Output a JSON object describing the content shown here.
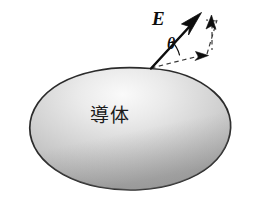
{
  "figure": {
    "background_color": "#ffffff",
    "width": 253,
    "height": 204
  },
  "labels": {
    "field_vector": "E",
    "angle": "θ",
    "conductor": "導体"
  },
  "colors": {
    "ink": "#0d0d0d",
    "outline": "#2b2b2b",
    "body_light": "#f2f2f2",
    "body_mid": "#c9c9c9",
    "body_dark": "#8f8f8f",
    "dashed": "#3a3a3a"
  },
  "geometry": {
    "origin": {
      "x": 151,
      "y": 68
    },
    "field_tip": {
      "x": 201,
      "y": 13
    },
    "normal_tip": {
      "x": 212,
      "y": 17
    },
    "tangent_tip": {
      "x": 206,
      "y": 56
    },
    "corner": {
      "x": 217,
      "y": 20
    },
    "blob_center": {
      "x": 130,
      "y": 132
    },
    "blob_rx": 101,
    "blob_ry": 62
  },
  "elements": {
    "field_arrow_name": "electric-field-vector-arrow",
    "normal_arrow_name": "normal-component-arrow",
    "tangent_arrow_name": "tangential-component-arrow",
    "angle_arc_name": "angle-arc",
    "conductor_name": "conductor-body",
    "surface_name": "conductor-surface-outline"
  }
}
